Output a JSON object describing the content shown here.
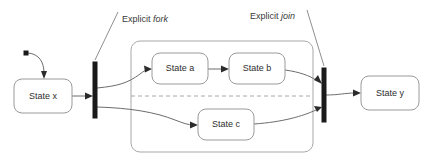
{
  "diagram": {
    "type": "uml-state-machine-diagram",
    "canvas": {
      "width": 434,
      "height": 163,
      "background": "#ffffff"
    },
    "colors": {
      "node_stroke": "#9a9a9a",
      "node_fill": "#ffffff",
      "transition_stroke": "#6d6d6d",
      "bar_fill": "#1a1a1a",
      "text": "#2e2e2e",
      "divider": "#a8a8a8"
    },
    "states": [
      {
        "id": "state_x",
        "label": "State x",
        "x": 14,
        "y": 79,
        "w": 58,
        "h": 34
      },
      {
        "id": "state_a",
        "label": "State a",
        "x": 152,
        "y": 53,
        "w": 56,
        "h": 31
      },
      {
        "id": "state_b",
        "label": "State b",
        "x": 229,
        "y": 53,
        "w": 56,
        "h": 31
      },
      {
        "id": "state_c",
        "label": "State c",
        "x": 198,
        "y": 109,
        "w": 56,
        "h": 31
      },
      {
        "id": "state_y",
        "label": "State y",
        "x": 361,
        "y": 76,
        "w": 58,
        "h": 34
      }
    ],
    "composite_state": {
      "id": "composite_region_container",
      "x": 131,
      "y": 41,
      "w": 182,
      "h": 111,
      "divider_y": 96,
      "regions": [
        "top-region",
        "bottom-region"
      ]
    },
    "bars": [
      {
        "id": "fork_bar",
        "label": "fork",
        "x": 93,
        "y": 62,
        "w": 4,
        "h": 56
      },
      {
        "id": "join_bar",
        "label": "join",
        "x": 322,
        "y": 68,
        "w": 4,
        "h": 54
      }
    ],
    "initial_pseudostate": {
      "id": "initial_marker",
      "cx": 26,
      "cy": 53,
      "size": 4
    },
    "annotations": [
      {
        "id": "fork_annotation",
        "prefix": "Explicit ",
        "emphasis": "fork",
        "x": 120,
        "y": 20
      },
      {
        "id": "join_annotation",
        "prefix": "Explicit ",
        "emphasis": "join",
        "x": 249,
        "y": 17
      }
    ],
    "transitions": [
      {
        "id": "initial_to_state_x",
        "from": "initial_marker",
        "to": "state_x"
      },
      {
        "id": "state_x_to_fork",
        "from": "state_x",
        "to": "fork_bar"
      },
      {
        "id": "fork_to_state_a",
        "from": "fork_bar",
        "to": "state_a"
      },
      {
        "id": "fork_to_state_c",
        "from": "fork_bar",
        "to": "state_c"
      },
      {
        "id": "state_a_to_state_b",
        "from": "state_a",
        "to": "state_b"
      },
      {
        "id": "state_b_to_join",
        "from": "state_b",
        "to": "join_bar"
      },
      {
        "id": "state_c_to_join",
        "from": "state_c",
        "to": "join_bar"
      },
      {
        "id": "join_to_state_y",
        "from": "join_bar",
        "to": "state_y"
      }
    ]
  }
}
